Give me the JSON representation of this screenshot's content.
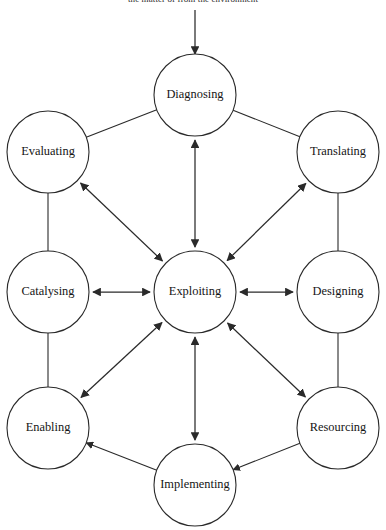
{
  "figure": {
    "caption_top": "the matter of from the environment",
    "title": "",
    "background_color": "#ffffff",
    "line_color": "#2a2a2a",
    "text_color": "#151515"
  },
  "center_node": {
    "id": "exploiting",
    "label": "Exploiting",
    "cx": 195,
    "cy": 292,
    "r": 41
  },
  "nodes": [
    {
      "id": "diagnosing",
      "label": "Diagnosing",
      "cx": 195,
      "cy": 95,
      "r": 41
    },
    {
      "id": "translating",
      "label": "Translating",
      "cx": 338,
      "cy": 152,
      "r": 41
    },
    {
      "id": "designing",
      "label": "Designing",
      "cx": 338,
      "cy": 292,
      "r": 41
    },
    {
      "id": "resourcing",
      "label": "Resourcing",
      "cx": 338,
      "cy": 428,
      "r": 41
    },
    {
      "id": "implementing",
      "label": "Implementing",
      "cx": 195,
      "cy": 485,
      "r": 41
    },
    {
      "id": "enabling",
      "label": "Enabling",
      "cx": 48,
      "cy": 428,
      "r": 41
    },
    {
      "id": "catalysing",
      "label": "Catalysing",
      "cx": 48,
      "cy": 292,
      "r": 41
    },
    {
      "id": "evaluating",
      "label": "Evaluating",
      "cx": 48,
      "cy": 152,
      "r": 41
    }
  ],
  "spokes": [
    {
      "from": "diagnosing",
      "to": "exploiting",
      "arrows": "both"
    },
    {
      "from": "translating",
      "to": "exploiting",
      "arrows": "both"
    },
    {
      "from": "designing",
      "to": "exploiting",
      "arrows": "both"
    },
    {
      "from": "resourcing",
      "to": "exploiting",
      "arrows": "both"
    },
    {
      "from": "implementing",
      "to": "exploiting",
      "arrows": "both"
    },
    {
      "from": "enabling",
      "to": "exploiting",
      "arrows": "both"
    },
    {
      "from": "catalysing",
      "to": "exploiting",
      "arrows": "both"
    },
    {
      "from": "evaluating",
      "to": "exploiting",
      "arrows": "both"
    }
  ],
  "ring_links": [
    {
      "from": "evaluating",
      "to": "diagnosing",
      "arrows": "none"
    },
    {
      "from": "diagnosing",
      "to": "translating",
      "arrows": "none"
    },
    {
      "from": "translating",
      "to": "designing",
      "arrows": "none"
    },
    {
      "from": "designing",
      "to": "resourcing",
      "arrows": "none"
    },
    {
      "from": "resourcing",
      "to": "implementing",
      "arrows": "to"
    },
    {
      "from": "implementing",
      "to": "enabling",
      "arrows": "to"
    },
    {
      "from": "enabling",
      "to": "catalysing",
      "arrows": "none"
    },
    {
      "from": "catalysing",
      "to": "evaluating",
      "arrows": "none"
    }
  ],
  "external_input": {
    "label": "",
    "target": "diagnosing",
    "arrows": "to",
    "from_x": 195,
    "from_y": 10,
    "to_x": 195,
    "to_y": 54
  }
}
